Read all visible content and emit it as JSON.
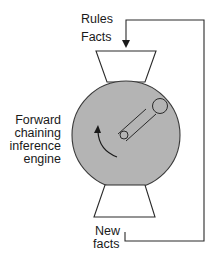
{
  "diagram": {
    "labels": {
      "rules": "Rules",
      "facts": "Facts",
      "engine_line1": "Forward",
      "engine_line2": "chaining",
      "engine_line3": "inference",
      "engine_line4": "engine",
      "new_facts_line1": "New",
      "new_facts_line2": "facts"
    },
    "colors": {
      "engine_fill": "#b4b4b4",
      "stroke": "#2a2a2a",
      "background": "#ffffff"
    },
    "nodes": [
      {
        "id": "input-hopper",
        "shape": "trapezoid",
        "label": "Rules / Facts input"
      },
      {
        "id": "engine",
        "shape": "circle",
        "label": "Forward chaining inference engine"
      },
      {
        "id": "output-hopper",
        "shape": "trapezoid",
        "label": "New facts output"
      }
    ],
    "edges": [
      {
        "from": "output-hopper",
        "to": "input-hopper",
        "type": "feedback-loop"
      }
    ]
  }
}
